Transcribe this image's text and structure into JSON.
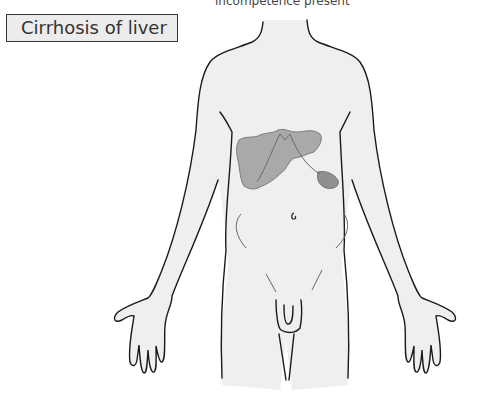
{
  "caption": {
    "top_text": "incompetence present"
  },
  "label": {
    "title": "Cirrhosis of liver"
  },
  "figure": {
    "organs": [
      {
        "name": "liver",
        "shading": "#a9a9a9",
        "state": "shrunken, irregular (cirrhotic)"
      },
      {
        "name": "spleen",
        "shading": "#8f8f8f"
      }
    ],
    "colors": {
      "body_fill": "#efefef",
      "outline": "#1a1a1a",
      "organ_edge": "#7a7a7a"
    }
  }
}
